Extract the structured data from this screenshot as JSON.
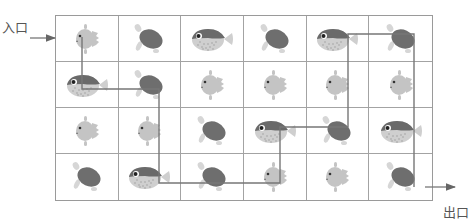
{
  "labels": {
    "entrance": "入口",
    "exit": "出口"
  },
  "legend_icons": {
    "sunfish": "sunfish-icon",
    "turtle": "turtle-icon",
    "puffer": "pufferfish-icon"
  },
  "colors": {
    "grid_line": "#a3a3a3",
    "path_line": "#777777",
    "sunfish_body": "#c4c4c4",
    "turtle_shell": "#6e6e6e",
    "turtle_flipper": "#d6d6d6",
    "puffer_top": "#6a6a6a",
    "puffer_belly": "#cfcfcf"
  },
  "grid": {
    "rows": 4,
    "cols": 6,
    "cells": [
      [
        "sunfish",
        "turtle",
        "puffer",
        "turtle",
        "puffer",
        "turtle"
      ],
      [
        "puffer",
        "turtle",
        "sunfish",
        "sunfish",
        "sunfish",
        "sunfish"
      ],
      [
        "sunfish",
        "sunfish",
        "turtle",
        "puffer",
        "turtle",
        "puffer"
      ],
      [
        "turtle",
        "puffer",
        "turtle",
        "sunfish",
        "sunfish",
        "turtle"
      ]
    ]
  },
  "path": {
    "points": [
      [
        82,
        37
      ],
      [
        82,
        89
      ],
      [
        159,
        89
      ],
      [
        159,
        183
      ],
      [
        280,
        183
      ],
      [
        280,
        127
      ],
      [
        348,
        127
      ],
      [
        348,
        34
      ],
      [
        414,
        34
      ],
      [
        414,
        187
      ]
    ],
    "entry_arrow": {
      "x1": 30,
      "y1": 38,
      "x2": 55,
      "y2": 38
    },
    "exit_arrow": {
      "x1": 425,
      "y1": 187,
      "x2": 455,
      "y2": 187
    }
  }
}
